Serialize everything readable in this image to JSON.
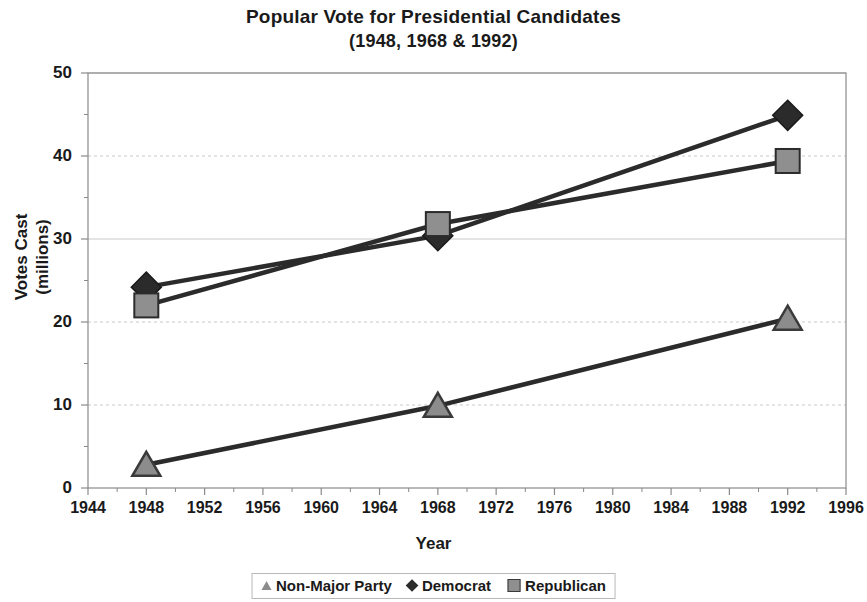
{
  "chart_data": {
    "type": "line",
    "title": "Popular Vote for Presidential Candidates",
    "subtitle": "(1948, 1968 & 1992)",
    "xlabel": "Year",
    "ylabel_line1": "Votes Cast",
    "ylabel_line2": "(millions)",
    "x": [
      1948,
      1968,
      1992
    ],
    "xlim": [
      1944,
      1996
    ],
    "ylim": [
      0,
      50
    ],
    "xticks": [
      "1944",
      "1948",
      "1952",
      "1956",
      "1960",
      "1964",
      "1968",
      "1972",
      "1976",
      "1980",
      "1984",
      "1988",
      "1992",
      "1996"
    ],
    "yticks": [
      "0",
      "10",
      "20",
      "30",
      "40",
      "50"
    ],
    "grid": "horizontal",
    "legend_position": "bottom",
    "series": [
      {
        "name": "Non-Major Party",
        "marker": "triangle",
        "color": "#8c8c8c",
        "line_color": "#2b2b2b",
        "values": [
          2.8,
          9.9,
          20.4
        ]
      },
      {
        "name": "Democrat",
        "marker": "diamond",
        "color": "#2b2b2b",
        "line_color": "#2b2b2b",
        "values": [
          24.2,
          30.4,
          44.9
        ]
      },
      {
        "name": "Republican",
        "marker": "square",
        "color": "#8f8f8f",
        "line_color": "#2b2b2b",
        "values": [
          22.0,
          31.8,
          39.4
        ]
      }
    ]
  },
  "legend": {
    "items": [
      {
        "label": "Non-Major Party"
      },
      {
        "label": "Democrat"
      },
      {
        "label": "Republican"
      }
    ]
  },
  "colors": {
    "axis": "#8a8a8a",
    "grid": "#c9c9c9",
    "text": "#1a1a1a",
    "line": "#2b2b2b",
    "republican_fill": "#8f8f8f",
    "nonmajor_fill": "#8c8c8c",
    "democrat_fill": "#2b2b2b"
  }
}
